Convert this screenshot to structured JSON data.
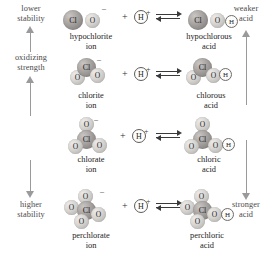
{
  "diagram": {
    "axes": {
      "left": {
        "top_label_line1": "lower",
        "top_label_line2": "stability",
        "middle_label_line1": "oxidizing",
        "middle_label_line2": "strength",
        "bottom_label_line1": "higher",
        "bottom_label_line2": "stability",
        "arrow_up_icon": "arrow-up-icon",
        "arrow_down_icon": "arrow-down-icon"
      },
      "right": {
        "top_label_line1": "weaker",
        "top_label_line2": "acid",
        "bottom_label_line1": "stronger",
        "bottom_label_line2": "acid",
        "arrow_up_icon": "arrow-up-icon",
        "arrow_down_icon": "arrow-down-icon"
      }
    },
    "plus_symbol": "+",
    "proton": {
      "label": "H",
      "charge": "+"
    },
    "equilibrium_icon": "equilibrium-arrow-icon",
    "rows": [
      {
        "id": "hypochlorite",
        "ion": {
          "name_line1": "hypochlorite",
          "name_line2": "ion",
          "charge": "–",
          "atoms": [
            {
              "element": "Cl",
              "x": 0,
              "y": 4,
              "d": 20
            },
            {
              "element": "O",
              "x": 22,
              "y": 7,
              "d": 15
            }
          ]
        },
        "acid": {
          "name_line1": "hypochlorous",
          "name_line2": "acid",
          "charge": "",
          "atoms": [
            {
              "element": "Cl",
              "x": 0,
              "y": 4,
              "d": 20
            },
            {
              "element": "O",
              "x": 22,
              "y": 7,
              "d": 15
            },
            {
              "element": "H",
              "x": 37,
              "y": 9,
              "d": 11
            }
          ]
        }
      },
      {
        "id": "chlorite",
        "ion": {
          "name_line1": "chlorite",
          "name_line2": "ion",
          "charge": "–",
          "atoms": [
            {
              "element": "Cl",
              "x": 7,
              "y": 0,
              "d": 19
            },
            {
              "element": "O",
              "x": 0,
              "y": 12,
              "d": 15
            },
            {
              "element": "O",
              "x": 20,
              "y": 10,
              "d": 15
            }
          ]
        },
        "acid": {
          "name_line1": "chlorous",
          "name_line2": "acid",
          "charge": "",
          "atoms": [
            {
              "element": "Cl",
              "x": 7,
              "y": 0,
              "d": 19
            },
            {
              "element": "O",
              "x": 0,
              "y": 12,
              "d": 15
            },
            {
              "element": "O",
              "x": 20,
              "y": 10,
              "d": 15
            },
            {
              "element": "H",
              "x": 33,
              "y": 10,
              "d": 11
            }
          ]
        }
      },
      {
        "id": "chlorate",
        "ion": {
          "name_line1": "chlorate",
          "name_line2": "ion",
          "charge": "–",
          "atoms": [
            {
              "element": "O",
              "x": 11,
              "y": 0,
              "d": 15
            },
            {
              "element": "Cl",
              "x": 9,
              "y": 13,
              "d": 19
            },
            {
              "element": "O",
              "x": 0,
              "y": 22,
              "d": 15
            },
            {
              "element": "O",
              "x": 24,
              "y": 21,
              "d": 15
            }
          ]
        },
        "acid": {
          "name_line1": "chloric",
          "name_line2": "acid",
          "charge": "",
          "atoms": [
            {
              "element": "O",
              "x": 11,
              "y": 0,
              "d": 15
            },
            {
              "element": "Cl",
              "x": 9,
              "y": 13,
              "d": 19
            },
            {
              "element": "O",
              "x": 0,
              "y": 22,
              "d": 15
            },
            {
              "element": "O",
              "x": 24,
              "y": 21,
              "d": 15
            },
            {
              "element": "H",
              "x": 38,
              "y": 21,
              "d": 11
            }
          ]
        }
      },
      {
        "id": "perchlorate",
        "ion": {
          "name_line1": "perchlorate",
          "name_line2": "ion",
          "charge": "–",
          "atoms": [
            {
              "element": "O",
              "x": 14,
              "y": 0,
              "d": 15
            },
            {
              "element": "O",
              "x": 0,
              "y": 11,
              "d": 15
            },
            {
              "element": "Cl",
              "x": 13,
              "y": 12,
              "d": 19
            },
            {
              "element": "O",
              "x": 27,
              "y": 18,
              "d": 15
            },
            {
              "element": "O",
              "x": 10,
              "y": 25,
              "d": 15
            }
          ]
        },
        "acid": {
          "name_line1": "perchloric",
          "name_line2": "acid",
          "charge": "",
          "atoms": [
            {
              "element": "O",
              "x": 14,
              "y": 0,
              "d": 15
            },
            {
              "element": "O",
              "x": 0,
              "y": 11,
              "d": 15
            },
            {
              "element": "Cl",
              "x": 13,
              "y": 12,
              "d": 19
            },
            {
              "element": "O",
              "x": 27,
              "y": 18,
              "d": 15
            },
            {
              "element": "O",
              "x": 10,
              "y": 25,
              "d": 15
            },
            {
              "element": "H",
              "x": 41,
              "y": 19,
              "d": 11
            }
          ]
        }
      }
    ]
  }
}
